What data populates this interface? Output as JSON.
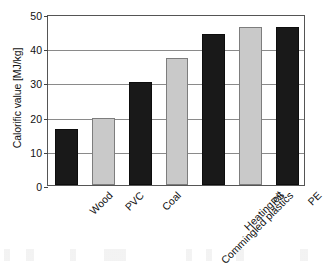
{
  "chart_data": {
    "type": "bar",
    "title": "",
    "xlabel": "",
    "ylabel": "Calorific value [MJ/kg]",
    "categories": [
      "Wood",
      "PVC",
      "Coal",
      "Commingled plastics",
      "Heating oil",
      "PS",
      "PE"
    ],
    "values": [
      16.3,
      19.5,
      30.0,
      37.0,
      44.2,
      46.3,
      46.2
    ],
    "bar_colors": [
      "#191919",
      "#c9c9c9",
      "#191919",
      "#c9c9c9",
      "#191919",
      "#c9c9c9",
      "#191919"
    ],
    "ylim": [
      0,
      50
    ],
    "yticks": [
      0,
      10,
      20,
      30,
      40,
      50
    ],
    "ytick_labels": [
      "0",
      "10",
      "20",
      "30",
      "40",
      "50"
    ],
    "grid": true,
    "grid_axis": "y",
    "legend": null,
    "legend_position": "none",
    "xtick_rotation": -45,
    "units": "MJ/kg",
    "accent_dark": "#191919",
    "accent_light": "#c9c9c9",
    "grid_color": "#8a8a8a",
    "axis_color": "#555555"
  }
}
